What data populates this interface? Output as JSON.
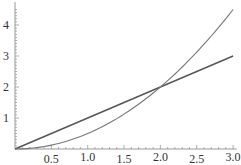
{
  "chart_data": {
    "type": "line",
    "title": "",
    "xlabel": "",
    "ylabel": "",
    "xlim": [
      0,
      3
    ],
    "ylim": [
      0,
      4.6
    ],
    "grid": false,
    "legend": null,
    "x_ticks": [
      "0.5",
      "1.0",
      "1.5",
      "2.0",
      "2.5",
      "3.0"
    ],
    "y_ticks": [
      "1",
      "2",
      "3",
      "4"
    ],
    "series": [
      {
        "name": "y = x",
        "x": [
          0,
          0.5,
          1,
          1.5,
          2,
          2.5,
          3
        ],
        "values": [
          0,
          0.5,
          1,
          1.5,
          2,
          2.5,
          3
        ],
        "color": "#555555"
      },
      {
        "name": "y = x^2/2",
        "x": [
          0,
          0.5,
          1,
          1.5,
          2,
          2.5,
          3
        ],
        "values": [
          0,
          0.125,
          0.5,
          1.125,
          2,
          3.125,
          4.5
        ],
        "color": "#777777"
      }
    ],
    "annotations": []
  }
}
